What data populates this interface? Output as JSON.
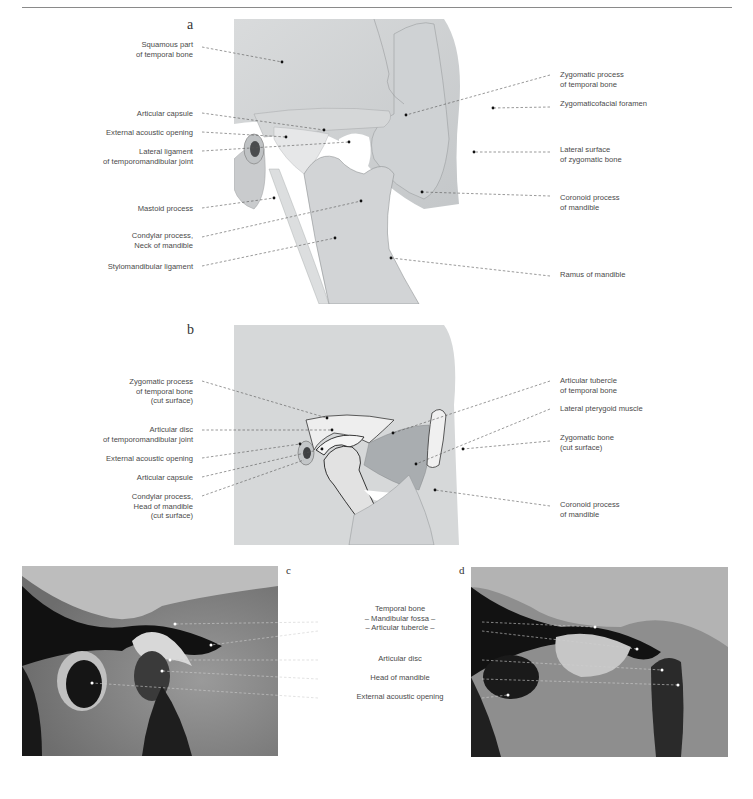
{
  "figure": {
    "panels": [
      {
        "id": "a",
        "letter": "a",
        "labels_left": [
          {
            "lines": [
              "Squamous part",
              "of temporal bone"
            ]
          },
          {
            "lines": [
              "Articular capsule"
            ]
          },
          {
            "lines": [
              "External acoustic opening"
            ]
          },
          {
            "lines": [
              "Lateral ligament",
              "of temporomandibular joint"
            ]
          },
          {
            "lines": [
              "Mastoid process"
            ]
          },
          {
            "lines": [
              "Condylar process,",
              "Neck of mandible"
            ]
          },
          {
            "lines": [
              "Stylomandibular ligament"
            ]
          }
        ],
        "labels_right": [
          {
            "lines": [
              "Zygomatic process",
              "of temporal bone"
            ]
          },
          {
            "lines": [
              "Zygomaticofacial foramen"
            ]
          },
          {
            "lines": [
              "Lateral surface",
              "of zygomatic bone"
            ]
          },
          {
            "lines": [
              "Coronoid process",
              "of mandible"
            ]
          },
          {
            "lines": [
              "Ramus of mandible"
            ]
          }
        ]
      },
      {
        "id": "b",
        "letter": "b",
        "labels_left": [
          {
            "lines": [
              "Zygomatic process",
              "of temporal bone",
              "(cut surface)"
            ]
          },
          {
            "lines": [
              "Articular disc",
              "of temporomandibular joint"
            ]
          },
          {
            "lines": [
              "External acoustic opening"
            ]
          },
          {
            "lines": [
              "Articular capsule"
            ]
          },
          {
            "lines": [
              "Condylar process,",
              "Head of mandible",
              "(cut surface)"
            ]
          }
        ],
        "labels_right": [
          {
            "lines": [
              "Articular tubercle",
              "of temporal bone"
            ]
          },
          {
            "lines": [
              "Lateral pterygoid muscle"
            ]
          },
          {
            "lines": [
              "Zygomatic bone",
              "(cut surface)"
            ]
          },
          {
            "lines": [
              "Coronoid process",
              "of mandible"
            ]
          }
        ]
      },
      {
        "id": "c",
        "letter": "c"
      },
      {
        "id": "d",
        "letter": "d"
      }
    ],
    "shared_mri_labels": [
      {
        "lines": [
          "Temporal bone",
          "– Mandibular fossa –",
          "– Articular tubercle –"
        ]
      },
      {
        "lines": [
          "Articular disc"
        ]
      },
      {
        "lines": [
          "Head of mandible"
        ]
      },
      {
        "lines": [
          "External acoustic opening"
        ]
      }
    ]
  }
}
